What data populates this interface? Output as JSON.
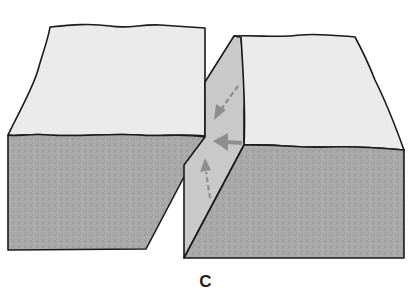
{
  "figure": {
    "caption": "C",
    "colors": {
      "top_face": "#ebebeb",
      "front_face": "#a9a9a9",
      "fault_plane": "#c9c9c9",
      "arrow": "#8e8e8e",
      "outline": "#1a1a1a",
      "background": "#ffffff"
    },
    "parts": [
      "left-block",
      "fault-plane",
      "right-block"
    ],
    "arrows": [
      {
        "name": "dip-arrow",
        "style": "dashed",
        "direction": "down-left"
      },
      {
        "name": "strike-arrow",
        "style": "solid",
        "direction": "left"
      },
      {
        "name": "oblique-arrow",
        "style": "dashed",
        "direction": "up"
      }
    ]
  }
}
